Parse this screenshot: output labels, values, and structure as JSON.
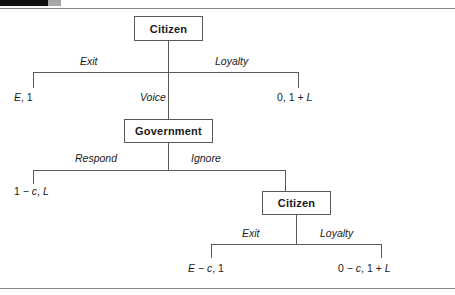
{
  "figure": {
    "type": "game-tree"
  },
  "nodes": {
    "root_citizen": "Citizen",
    "government": "Government",
    "second_citizen": "Citizen"
  },
  "edges": {
    "exit_top": "Exit",
    "voice": "Voice",
    "loyalty_top": "Loyalty",
    "respond": "Respond",
    "ignore": "Ignore",
    "exit_bottom": "Exit",
    "loyalty_bottom": "Loyalty"
  },
  "payoffs": {
    "exit_top": "E, 1",
    "loyalty_top": "0, 1 + L",
    "respond": "1 − c, L",
    "exit_bottom": "E − c, 1",
    "loyalty_bottom": "0 − c, 1 + L"
  },
  "colors": {
    "line": "#5a5a5a",
    "box_border": "#595959",
    "text": "#1a1a1a",
    "rule": "#8a8a8a",
    "tab_black": "#111111",
    "tab_gray": "#a8a8a8"
  }
}
